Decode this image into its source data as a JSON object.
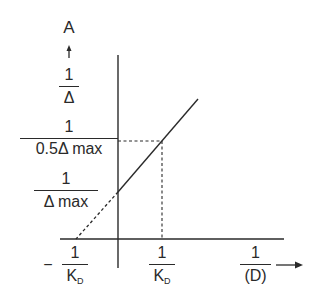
{
  "diagram": {
    "type": "double-reciprocal plot",
    "y_axis": {
      "name": "A",
      "arrow": "up-arrow",
      "label_num": "1",
      "label_den": "Δ"
    },
    "x_axis": {
      "label_num": "1",
      "label_den": "(D)",
      "arrow": "right-arrow"
    },
    "y_markers": [
      {
        "num": "1",
        "den": "0.5Δ max"
      },
      {
        "num": "1",
        "den": "Δ max"
      }
    ],
    "x_markers": [
      {
        "sign": "−",
        "num": "1",
        "den_main": "K",
        "den_sub": "D"
      },
      {
        "sign": "",
        "num": "1",
        "den_main": "K",
        "den_sub": "D"
      }
    ],
    "line": {
      "solid_segment": "from y-intercept 1/Δmax upward",
      "dashed_extrapolation": "to x-intercept −1/K_D"
    },
    "colors": {
      "ink": "#2a2a2a",
      "background": "#ffffff"
    }
  }
}
